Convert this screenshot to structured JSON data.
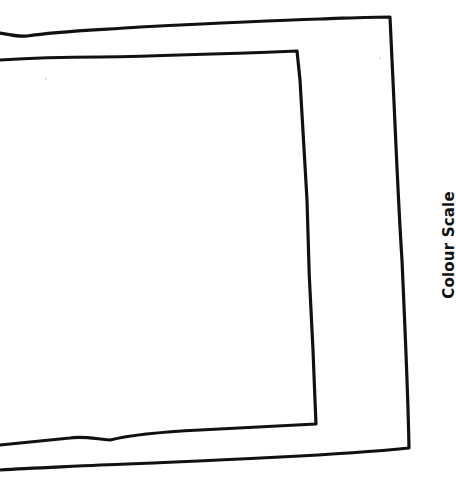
{
  "diagram": {
    "label": "Colour Scale",
    "stroke_color": "#111111",
    "background_color": "#ffffff",
    "frames": [
      {
        "name": "outer-frame",
        "path": "M0,33 C10,35 18,37 27,36 C60,31 100,30 140,27 C200,24 260,21 320,19 C350,18 370,17 390,17 L392,60 C395,120 398,200 402,260 C405,330 408,390 409,448 C370,452 320,455 280,457 C220,460 160,463 100,465 C60,467 30,468 0,470"
      },
      {
        "name": "inner-frame",
        "path": "M0,60 C30,58 60,57 100,57 C160,56 220,54 297,51 L300,80 C303,130 305,170 307,200 C308,250 310,300 313,350 C314,380 315,400 316,424 C280,426 240,428 200,430 C160,432 130,435 110,440 C90,438 80,436 70,438 C40,441 20,443 0,445"
      }
    ]
  }
}
